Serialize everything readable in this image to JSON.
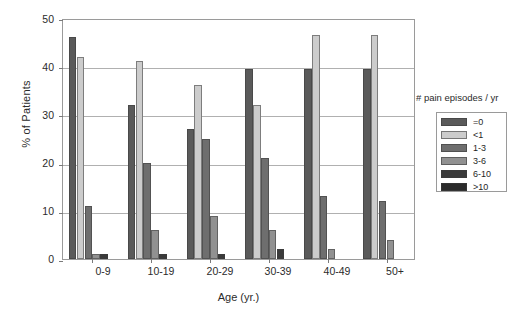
{
  "chart_data": {
    "type": "bar",
    "title": "",
    "subtitle": "",
    "xlabel": "Age (yr.)",
    "ylabel": "% of Patients",
    "legend_title": "# pain episodes / yr",
    "legend_position": "right",
    "grid": true,
    "ylim": [
      0,
      50
    ],
    "yticks": [
      0,
      10,
      20,
      30,
      40,
      50
    ],
    "ytick_labels": [
      "0",
      "10",
      "20",
      "30",
      "40",
      "50"
    ],
    "categories": [
      "0-9",
      "10-19",
      "20-29",
      "30-39",
      "40-49",
      "50+"
    ],
    "series": [
      {
        "name": "=0",
        "color": "#5a5a5a",
        "values": [
          46,
          32,
          27,
          39.5,
          39.5,
          39.5
        ]
      },
      {
        "name": "<1",
        "color": "#cccccc",
        "values": [
          42,
          41,
          36,
          32,
          46.5,
          46.5
        ]
      },
      {
        "name": "1-3",
        "color": "#6e6e6e",
        "values": [
          11,
          20,
          25,
          21,
          13,
          12
        ]
      },
      {
        "name": "3-6",
        "color": "#919191",
        "values": [
          1,
          6,
          9,
          6,
          2,
          4
        ]
      },
      {
        "name": "6-10",
        "color": "#3a3a3a",
        "values": [
          1,
          1,
          1,
          2,
          0,
          0
        ]
      },
      {
        "name": ">10",
        "color": "#2a2a2a",
        "values": [
          0,
          0,
          0,
          0,
          0,
          0
        ]
      }
    ]
  },
  "axes": {
    "y_title": "% of Patients",
    "x_title": "Age (yr.)",
    "y_tick_0": "0",
    "y_tick_1": "10",
    "y_tick_2": "20",
    "y_tick_3": "30",
    "y_tick_4": "40",
    "y_tick_5": "50",
    "x_tick_0": "0-9",
    "x_tick_1": "10-19",
    "x_tick_2": "20-29",
    "x_tick_3": "30-39",
    "x_tick_4": "40-49",
    "x_tick_5": "50+"
  },
  "legend": {
    "title": "# pain episodes / yr",
    "entries": [
      {
        "label": "=0"
      },
      {
        "label": "<1"
      },
      {
        "label": "1-3"
      },
      {
        "label": "3-6"
      },
      {
        "label": "6-10"
      },
      {
        "label": ">10"
      }
    ]
  }
}
